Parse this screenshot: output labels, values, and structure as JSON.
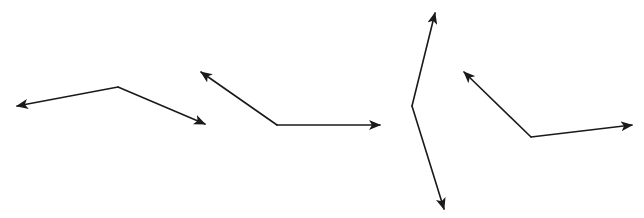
{
  "diagram": {
    "stroke_color": "#1a1a1a",
    "background": "#ffffff",
    "angles": [
      {
        "id": "angle-1",
        "vertex": [
          118,
          87
        ],
        "ray_ends": [
          [
            17,
            106
          ],
          [
            205,
            124
          ]
        ]
      },
      {
        "id": "angle-2",
        "vertex": [
          277,
          125
        ],
        "ray_ends": [
          [
            201,
            72
          ],
          [
            380,
            125
          ]
        ]
      },
      {
        "id": "angle-3",
        "vertex": [
          412,
          106
        ],
        "ray_ends": [
          [
            435,
            13
          ],
          [
            444,
            209
          ]
        ]
      },
      {
        "id": "angle-4",
        "vertex": [
          531,
          137
        ],
        "ray_ends": [
          [
            464,
            72
          ],
          [
            632,
            125
          ]
        ]
      }
    ]
  }
}
